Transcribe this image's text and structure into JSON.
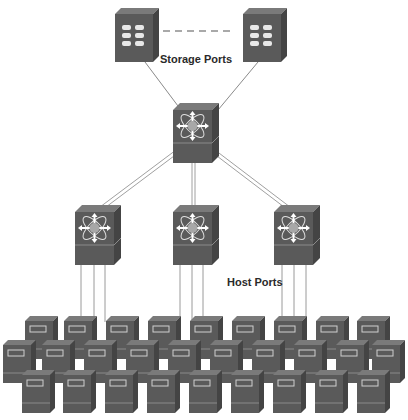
{
  "labels": {
    "storage_ports": "Storage Ports",
    "host_ports": "Host Ports"
  },
  "colors": {
    "device_front": "#5a5a5a",
    "device_top": "#7a7a7a",
    "device_side": "#444444",
    "link": "#9a9a9a",
    "switch_core": "#a8a8a8"
  },
  "nodes": {
    "storage_arrays": [
      {
        "name": "storage-array-1",
        "x": 115,
        "y": 8
      },
      {
        "name": "storage-array-2",
        "x": 243,
        "y": 8
      }
    ],
    "core_switch": {
      "name": "core-switch",
      "x": 173,
      "y": 103
    },
    "edge_switches": [
      {
        "name": "edge-switch-1",
        "x": 75,
        "y": 205
      },
      {
        "name": "edge-switch-2",
        "x": 173,
        "y": 205
      },
      {
        "name": "edge-switch-3",
        "x": 274,
        "y": 205
      }
    ],
    "host_rows": [
      {
        "y": 316,
        "xs": [
          25,
          64,
          106,
          148,
          190,
          232,
          274,
          316,
          357
        ]
      },
      {
        "y": 340,
        "xs": [
          3,
          42,
          84,
          126,
          168,
          210,
          252,
          294,
          336,
          377
        ]
      },
      {
        "y": 370,
        "xs": [
          22,
          63,
          105,
          147,
          189,
          231,
          273,
          315,
          357
        ]
      }
    ]
  }
}
